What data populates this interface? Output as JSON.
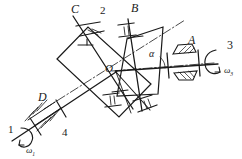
{
  "diagram": {
    "background_color": "#ffffff",
    "line_color": "#1a1a1a",
    "labels": {
      "center": "O",
      "angle": "α",
      "bearing_a": "A",
      "bearing_b": "B",
      "bearing_c": "C",
      "bearing_d": "D",
      "shaft_1": "1",
      "shaft_2": "2",
      "shaft_3": "3",
      "shaft_4": "4",
      "omega_1_symbol": "ω",
      "omega_1_sub": "1",
      "omega_3_symbol": "ω",
      "omega_3_sub": "3"
    },
    "icons": {
      "rotation_arrow_left": "curved-arrow-icon",
      "rotation_arrow_right": "curved-arrow-icon",
      "bearing_hatch": "bearing-hatch-icon",
      "plain-bearing": "plain-bearing-icon",
      "centerline": "dash-dot-centerline-icon"
    }
  }
}
